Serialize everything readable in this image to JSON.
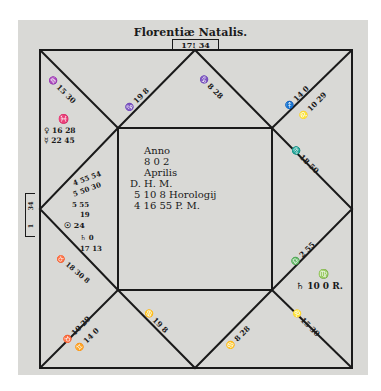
{
  "title": "Florentiæ Natalis.",
  "top_box": "17! 34",
  "side_box": [
    "1",
    "34"
  ],
  "center": {
    "line1": "Anno",
    "line2": "8 0 2",
    "line3": "Aprilis",
    "line4": "D. H. M.",
    "line5": "5 10   8 Horologij",
    "line6": "4 16 55 P. M."
  },
  "houses": {
    "h12_cusp": "♒ 15 30",
    "h12_planets": [
      "♓",
      "♀ 16 28",
      "☿ 22 45"
    ],
    "h11_cusp": "♑ 19 8",
    "h10_cusp": "♑ 8 28",
    "h9_cusp": "♐ 14 0",
    "h9_cusp2": "♌ 10 29",
    "h8_cusp": "♏",
    "h8_cusp2": "♏ 18 50",
    "h1_cluster": [
      "4 55 54",
      "5 50 30",
      "5 55",
      "19",
      "☉ 24",
      "♄ 0",
      "17 13",
      "♉ 18 30 8"
    ],
    "h7_cusp": "♎ 2 55",
    "h7_planets": [
      "♍",
      "♄ 10 0 R."
    ],
    "h6_cusp": "♌ 15 30",
    "h5_cusp": "♋ 19 8",
    "h4_cusp": "♋ 8 28",
    "h3_cusp": "♉ 10 29",
    "h3_cusp2": "♊ 14 0"
  }
}
